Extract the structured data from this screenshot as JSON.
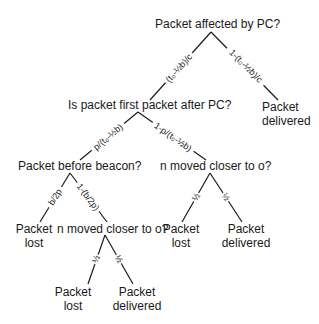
{
  "diagram": {
    "type": "decision-tree",
    "nodes": {
      "root": "Packet affected by PC?",
      "first_packet": "Is packet first packet after PC?",
      "before_beacon": "Packet before beacon?",
      "moved_closer_right": "n moved closer to o?",
      "moved_closer_bottom": "n moved closer to o?"
    },
    "leaves": {
      "root_right": [
        "Packet",
        "delivered"
      ],
      "beacon_left": [
        "Packet",
        "lost"
      ],
      "right_left": [
        "Packet",
        "lost"
      ],
      "right_right": [
        "Packet",
        "delivered"
      ],
      "bottom_left": [
        "Packet",
        "lost"
      ],
      "bottom_right": [
        "Packet",
        "delivered"
      ]
    },
    "edges": {
      "root_left": "(t₀-½b)/c",
      "root_right": "1-(t₀-½b)/c",
      "first_left": "p/(t₀-½b)",
      "first_right": "1-p/(t₀-½b)",
      "beacon_left": "b/2p",
      "beacon_right": "1-(b/2p)",
      "right_left": "½",
      "right_right": "½",
      "bottom_left": "½",
      "bottom_right": "½"
    }
  }
}
